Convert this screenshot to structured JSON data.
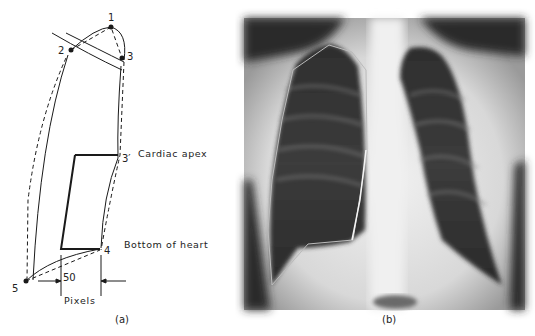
{
  "figure": {
    "panel_a": {
      "caption": "(a)",
      "points": [
        {
          "id": "1",
          "label": "1"
        },
        {
          "id": "2",
          "label": "2"
        },
        {
          "id": "3",
          "label": "3"
        },
        {
          "id": "3p",
          "label": "3′"
        },
        {
          "id": "4",
          "label": "4"
        },
        {
          "id": "5",
          "label": "5"
        }
      ],
      "annotations": {
        "cardiac_apex": "Cardiac apex",
        "bottom_of_heart": "Bottom of heart",
        "scale_value": "50",
        "scale_unit": "Pixels"
      }
    },
    "panel_b": {
      "caption": "(b)",
      "description": "Chest X-ray with polygonal outline of right lung field"
    }
  },
  "colors": {
    "ink": "#1a1a1a",
    "xray_dark": "#2a2a2a",
    "xray_light": "#e8e8e8",
    "background": "#ffffff"
  }
}
